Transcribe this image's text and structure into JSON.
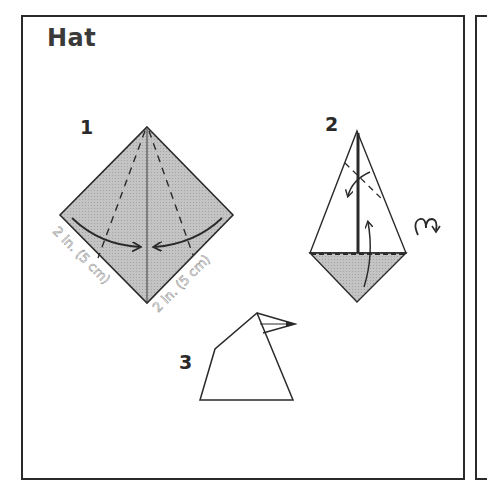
{
  "title": "Hat",
  "colors": {
    "paper_shade": "#bdbdbd",
    "line": "#2a2a2a",
    "background": "#ffffff"
  },
  "steps": [
    {
      "number": "1",
      "description": "Square diamond, shaded; valley folds both sides to center",
      "dimension_labels": [
        "2 in. (5 cm)",
        "2 in. (5 cm)"
      ]
    },
    {
      "number": "2",
      "description": "Kite shape; fold bottom flap up, fold tip down",
      "turn_over_icon": "turn-over-icon"
    },
    {
      "number": "3",
      "description": "Finished hat"
    }
  ]
}
